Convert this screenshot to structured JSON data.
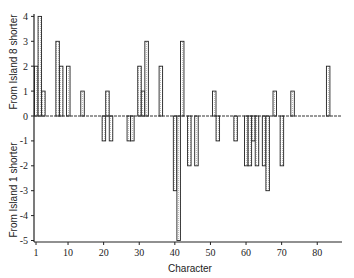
{
  "chart_data": {
    "type": "bar",
    "title": "",
    "xlabel": "Character",
    "ylabel_top": "From Island 8 shorter",
    "ylabel_bottom": "From Island 1 shorter",
    "xlim": [
      1,
      87
    ],
    "ylim": [
      -5,
      4
    ],
    "x_ticks": [
      1,
      10,
      20,
      30,
      40,
      50,
      60,
      70,
      80
    ],
    "y_ticks": [
      -5,
      -4,
      -3,
      -2,
      -1,
      0,
      1,
      2,
      3,
      4
    ],
    "grid": false,
    "legend": null,
    "zero_line": "dashed",
    "bar_fill": "hatched-gray",
    "x": [
      1,
      2,
      3,
      7,
      8,
      10,
      14,
      20,
      21,
      22,
      27,
      28,
      30,
      31,
      32,
      36,
      40,
      41,
      42,
      44,
      46,
      51,
      52,
      57,
      60,
      61,
      62,
      63,
      65,
      66,
      68,
      70,
      73,
      83
    ],
    "values": [
      2,
      4,
      1,
      3,
      2,
      2,
      1,
      -1,
      1,
      -1,
      -1,
      -1,
      2,
      1,
      3,
      2,
      -3,
      -5,
      3,
      -2,
      -2,
      1,
      -1,
      -1,
      -2,
      -2,
      -1,
      -2,
      -2,
      -3,
      1,
      -2,
      1,
      2
    ]
  }
}
